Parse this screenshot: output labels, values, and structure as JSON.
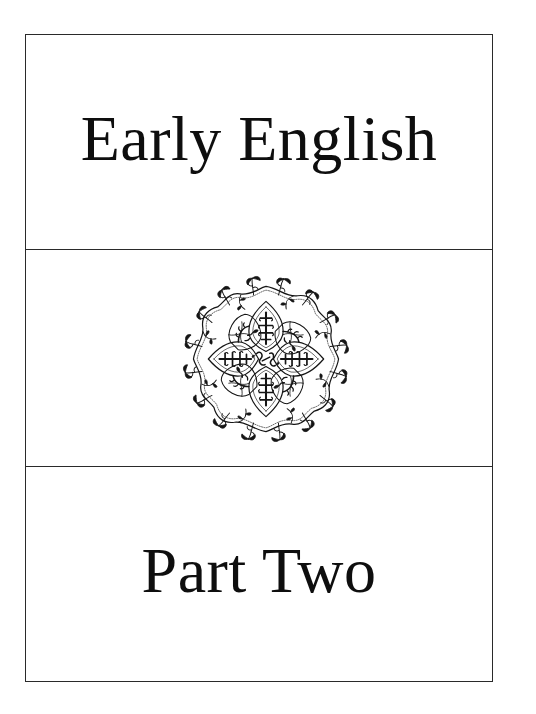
{
  "page": {
    "title": "Early English",
    "subtitle": "Part Two"
  },
  "ornament": {
    "icon": "floral-rosette-icon",
    "description": "Circular floral arabesque rosette ornament"
  },
  "colors": {
    "ink": "#111111",
    "rule": "#2a2a2a",
    "paper": "#ffffff"
  }
}
